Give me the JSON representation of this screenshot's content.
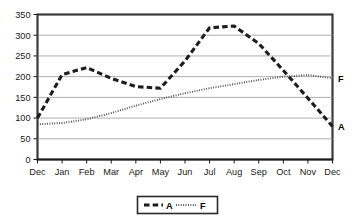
{
  "chart_data": {
    "type": "line",
    "title": "",
    "xlabel": "",
    "ylabel": "",
    "ylim": [
      0,
      350
    ],
    "ytick_step": 50,
    "grid": true,
    "legend_position": "bottom-center",
    "categories": [
      "Dec",
      "Jan",
      "Feb",
      "Mar",
      "Apr",
      "May",
      "Jun",
      "Jul",
      "Aug",
      "Sep",
      "Oct",
      "Nov",
      "Dec"
    ],
    "yticks": [
      "0",
      "50",
      "100",
      "150",
      "200",
      "250",
      "300",
      "350"
    ],
    "series": [
      {
        "name": "A",
        "style": "dashed",
        "end_label": "A",
        "values": [
          100,
          205,
          222,
          196,
          176,
          172,
          238,
          318,
          322,
          280,
          215,
          148,
          80
        ]
      },
      {
        "name": "F",
        "style": "dotted",
        "end_label": "F",
        "values": [
          85,
          88,
          97,
          112,
          130,
          146,
          160,
          172,
          182,
          192,
          200,
          204,
          196
        ]
      }
    ],
    "legend": [
      {
        "label": "A",
        "style": "dashed"
      },
      {
        "label": "F",
        "style": "dotted"
      }
    ]
  }
}
